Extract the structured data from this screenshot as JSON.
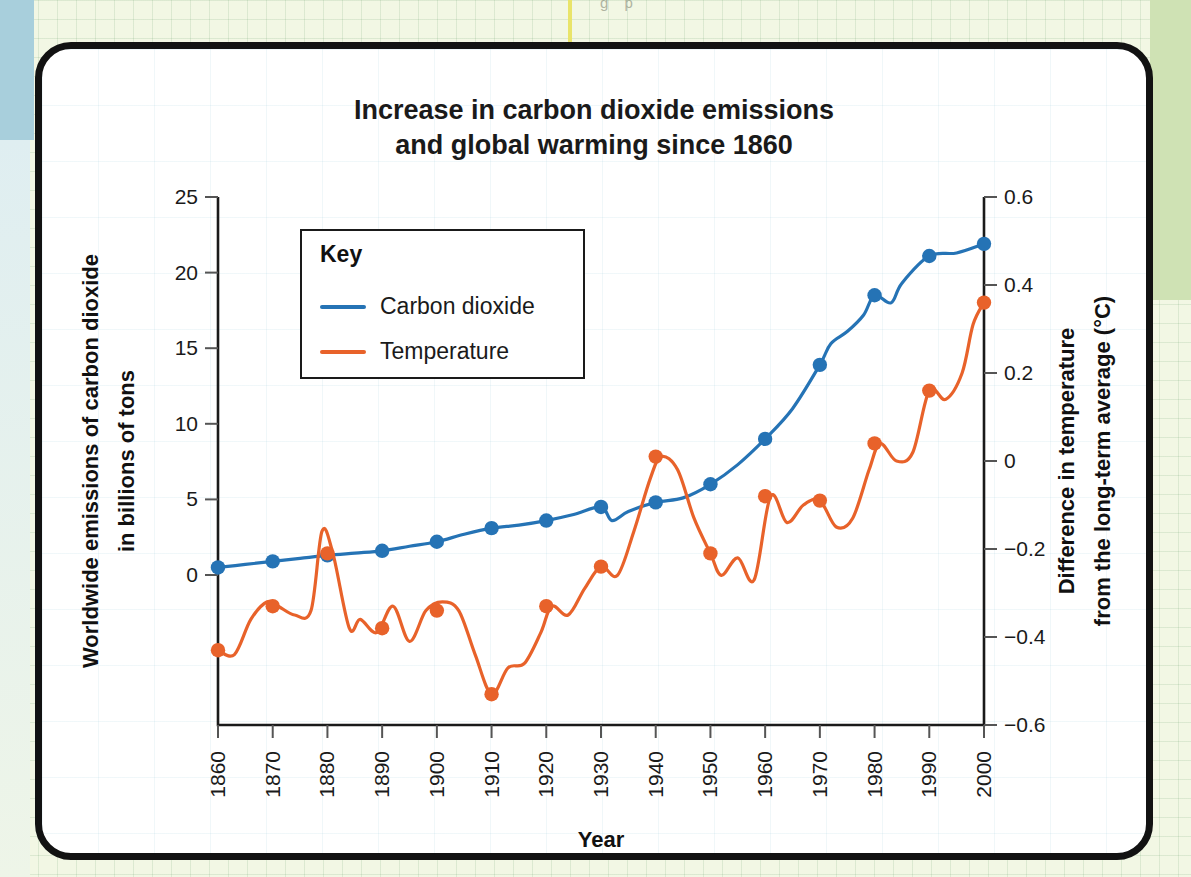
{
  "background": {
    "partial_top_text": "g       p"
  },
  "chart_data": {
    "type": "line",
    "title_line1": "Increase in carbon dioxide emissions",
    "title_line2": "and global warming since 1860",
    "xlabel": "Year",
    "ylabel_left": "Worldwide emissions of carbon dioxide in billions of tons",
    "ylabel_left_line1": "Worldwide emissions of carbon dioxide",
    "ylabel_left_line2": "in billions of tons",
    "ylabel_right": "Difference in temperature from the long-term average (°C)",
    "ylabel_right_line1": "Difference in temperature",
    "ylabel_right_line2": "from the long-term average (°C)",
    "grid": false,
    "legend_position": "inside-upper-left",
    "legend_title": "Key",
    "x": [
      1860,
      1870,
      1880,
      1890,
      1900,
      1910,
      1920,
      1930,
      1940,
      1950,
      1960,
      1970,
      1980,
      1990,
      2000
    ],
    "xtick_labels": [
      "1860",
      "1870",
      "1880",
      "1890",
      "1900",
      "1910",
      "1920",
      "1930",
      "1940",
      "1950",
      "1960",
      "1970",
      "1980",
      "1990",
      "2000"
    ],
    "xlim": [
      1860,
      2000
    ],
    "ylim_left": [
      -5.5,
      25
    ],
    "ytick_values_left": [
      0,
      5,
      10,
      15,
      20,
      25
    ],
    "ytick_labels_left": [
      "0",
      "5",
      "10",
      "15",
      "20",
      "25"
    ],
    "ylim_right": [
      -0.6,
      0.6
    ],
    "ytick_values_right": [
      -0.6,
      -0.4,
      -0.2,
      0,
      0.2,
      0.4,
      0.6
    ],
    "ytick_labels_right": [
      "−0.6",
      "−0.4",
      "−0.2",
      "0",
      "0.2",
      "0.4",
      "0.6"
    ],
    "series": [
      {
        "name": "Carbon dioxide",
        "axis": "left",
        "color": "#2573B5",
        "units": "billions of tons",
        "marker_years": [
          1860,
          1870,
          1880,
          1890,
          1900,
          1910,
          1920,
          1930,
          1940,
          1950,
          1960,
          1970,
          1980,
          1990,
          2000
        ],
        "values": [
          0.5,
          0.9,
          1.3,
          1.6,
          2.2,
          3.1,
          3.6,
          4.5,
          4.8,
          6.0,
          9.0,
          13.9,
          18.5,
          21.1,
          21.9
        ],
        "dense_x": [
          1860,
          1865,
          1870,
          1875,
          1880,
          1885,
          1890,
          1895,
          1900,
          1905,
          1910,
          1915,
          1920,
          1925,
          1930,
          1932,
          1935,
          1940,
          1945,
          1950,
          1955,
          1960,
          1965,
          1970,
          1972,
          1975,
          1978,
          1980,
          1983,
          1985,
          1990,
          1995,
          2000
        ],
        "dense_values": [
          0.5,
          0.7,
          0.9,
          1.1,
          1.3,
          1.45,
          1.6,
          1.9,
          2.2,
          2.7,
          3.1,
          3.3,
          3.6,
          4.0,
          4.5,
          3.6,
          4.2,
          4.8,
          5.1,
          6.0,
          7.3,
          9.0,
          11.0,
          13.9,
          15.3,
          16.1,
          17.2,
          18.5,
          18.0,
          19.3,
          21.1,
          21.3,
          21.9
        ]
      },
      {
        "name": "Temperature",
        "axis": "right",
        "color": "#E8622A",
        "units": "°C",
        "marker_years": [
          1860,
          1870,
          1880,
          1890,
          1900,
          1910,
          1920,
          1930,
          1940,
          1950,
          1960,
          1970,
          1980,
          1990,
          2000
        ],
        "values": [
          -0.43,
          -0.33,
          -0.21,
          -0.38,
          -0.34,
          -0.53,
          -0.33,
          -0.24,
          0.01,
          -0.21,
          -0.08,
          -0.09,
          0.04,
          0.16,
          0.36
        ],
        "dense_x": [
          1860,
          1863,
          1866,
          1869,
          1871,
          1874,
          1877,
          1879,
          1881,
          1884,
          1886,
          1889,
          1892,
          1895,
          1898,
          1901,
          1904,
          1907,
          1910,
          1913,
          1916,
          1919,
          1921,
          1924,
          1927,
          1930,
          1933,
          1936,
          1939,
          1941,
          1944,
          1947,
          1950,
          1952,
          1955,
          1958,
          1961,
          1964,
          1967,
          1970,
          1973,
          1976,
          1979,
          1981,
          1984,
          1987,
          1990,
          1993,
          1996,
          1998,
          2000
        ],
        "dense_values": [
          -0.43,
          -0.44,
          -0.36,
          -0.32,
          -0.33,
          -0.35,
          -0.34,
          -0.16,
          -0.21,
          -0.38,
          -0.36,
          -0.39,
          -0.33,
          -0.41,
          -0.34,
          -0.32,
          -0.34,
          -0.44,
          -0.53,
          -0.47,
          -0.46,
          -0.39,
          -0.33,
          -0.35,
          -0.29,
          -0.24,
          -0.26,
          -0.16,
          -0.04,
          0.01,
          -0.02,
          -0.13,
          -0.21,
          -0.26,
          -0.22,
          -0.27,
          -0.08,
          -0.14,
          -0.1,
          -0.09,
          -0.15,
          -0.13,
          -0.02,
          0.04,
          0.0,
          0.02,
          0.16,
          0.14,
          0.2,
          0.31,
          0.36
        ]
      }
    ]
  }
}
